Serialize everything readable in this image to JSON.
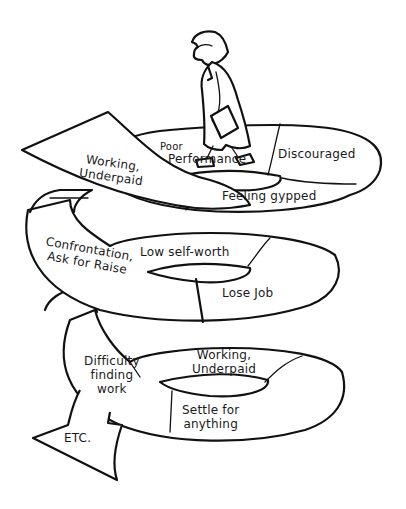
{
  "diagram": {
    "type": "downward-spiral",
    "ink_color": "#111111",
    "background": "#ffffff",
    "figure": "dejected man in suit carrying folder, walking down spiral",
    "stages": [
      {
        "id": "s1",
        "label_lines": [
          "Working,",
          "Underpaid"
        ]
      },
      {
        "id": "s2",
        "label_lines": [
          "Poor",
          "Performance"
        ]
      },
      {
        "id": "s3",
        "label_lines": [
          "Discouraged"
        ]
      },
      {
        "id": "s4",
        "label_lines": [
          "Feeling gypped"
        ]
      },
      {
        "id": "s5",
        "label_lines": [
          "Low self-worth"
        ]
      },
      {
        "id": "s6",
        "label_lines": [
          "Confrontation,",
          "Ask for Raise"
        ]
      },
      {
        "id": "s7",
        "label_lines": [
          "Lose Job"
        ]
      },
      {
        "id": "s8",
        "label_lines": [
          "Difficulty",
          "finding",
          "work"
        ]
      },
      {
        "id": "s9",
        "label_lines": [
          "Working,",
          "Underpaid"
        ]
      },
      {
        "id": "s10",
        "label_lines": [
          "Settle for",
          "anything"
        ]
      },
      {
        "id": "s11",
        "label_lines": [
          "ETC."
        ]
      }
    ]
  }
}
